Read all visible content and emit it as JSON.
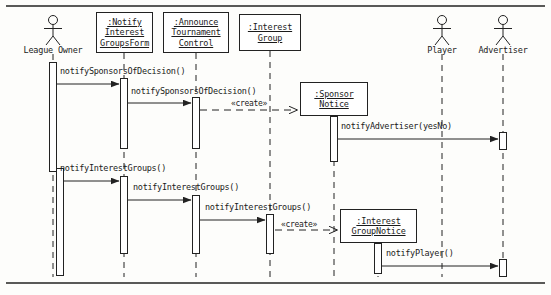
{
  "diagram": {
    "type": "uml-sequence-diagram",
    "title": "",
    "frame": {
      "top_rule_y": 6,
      "bottom_rule_y": 283
    },
    "participants": [
      {
        "id": "leagueOwner",
        "kind": "actor",
        "label": "League Owner",
        "x": 53
      },
      {
        "id": "notifyForm",
        "kind": "object",
        "label_lines": [
          ":Notify",
          "Interest",
          "GroupsForm"
        ],
        "x": 124
      },
      {
        "id": "announceControl",
        "kind": "object",
        "label_lines": [
          ":Announce",
          "Tournament",
          "Control"
        ],
        "x": 196
      },
      {
        "id": "interestGroup",
        "kind": "object",
        "label_lines": [
          ":Interest",
          "Group"
        ],
        "x": 270
      },
      {
        "id": "sponsorNotice",
        "kind": "object",
        "label_lines": [
          ":Sponsor",
          "Notice"
        ],
        "x": 334
      },
      {
        "id": "interestGroupNotice",
        "kind": "object",
        "label_lines": [
          ":Interest",
          "GroupNotice"
        ],
        "x": 378
      },
      {
        "id": "player",
        "kind": "actor",
        "label": "Player",
        "x": 442
      },
      {
        "id": "advertiser",
        "kind": "actor",
        "label": "Advertiser",
        "x": 503
      }
    ],
    "messages": [
      {
        "seq": 1,
        "label": "notifySponsorsOfDecision()",
        "from": "leagueOwner",
        "to": "notifyForm",
        "kind": "call",
        "y": 76
      },
      {
        "seq": 2,
        "label": "notifySponsorsOfDecision()",
        "from": "notifyForm",
        "to": "announceControl",
        "kind": "call",
        "y": 95
      },
      {
        "seq": 3,
        "label": "«create»",
        "from": "announceControl",
        "to": "sponsorNotice",
        "kind": "create",
        "y": 110
      },
      {
        "seq": 4,
        "label": "notifyAdvertiser(yesNo)",
        "from": "sponsorNotice",
        "to": "advertiser",
        "kind": "call",
        "y": 131
      },
      {
        "seq": 5,
        "label": "notifyInterestGroups()",
        "from": "leagueOwner",
        "to": "notifyForm",
        "kind": "call",
        "y": 173
      },
      {
        "seq": 6,
        "label": "notifyInterestGroups()",
        "from": "notifyForm",
        "to": "announceControl",
        "kind": "call",
        "y": 192
      },
      {
        "seq": 7,
        "label": "notifyInterestGroups()",
        "from": "announceControl",
        "to": "interestGroup",
        "kind": "call",
        "y": 212
      },
      {
        "seq": 8,
        "label": "«create»",
        "from": "interestGroup",
        "to": "interestGroupNotice",
        "kind": "create",
        "y": 222
      },
      {
        "seq": 9,
        "label": "notifyPlayer()",
        "from": "interestGroupNotice",
        "to": "advertiser",
        "kind": "call",
        "y": 258
      }
    ],
    "colors": {
      "line": "#222222",
      "box_fill": "#ffffff",
      "page": "#fdfdfb"
    }
  }
}
